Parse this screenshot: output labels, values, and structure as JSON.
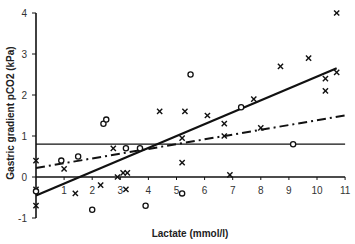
{
  "chart_data": {
    "type": "scatter",
    "title": "",
    "xlabel": "Lactate (mmol/l)",
    "ylabel": "Gastric gradient pCO2 (kPa)",
    "xlim": [
      0,
      11
    ],
    "ylim": [
      -1,
      4
    ],
    "x_ticks": [
      "1",
      "2",
      "3",
      "4",
      "5",
      "6",
      "7",
      "8",
      "9",
      "10",
      "11"
    ],
    "y_ticks": [
      "-1",
      "0",
      "1",
      "2",
      "3",
      "4"
    ],
    "grid": false,
    "legend": null,
    "series": [
      {
        "name": "crosses",
        "marker": "x",
        "points": [
          [
            0,
            0.4
          ],
          [
            0,
            -0.3
          ],
          [
            0,
            -0.7
          ],
          [
            1.0,
            0.2
          ],
          [
            1.4,
            -0.4
          ],
          [
            2.3,
            -0.2
          ],
          [
            2.75,
            0.7
          ],
          [
            2.9,
            0.0
          ],
          [
            3.1,
            0.1
          ],
          [
            3.25,
            0.1
          ],
          [
            3.2,
            -0.3
          ],
          [
            4.4,
            1.6
          ],
          [
            5.3,
            1.6
          ],
          [
            5.2,
            0.95
          ],
          [
            5.2,
            0.35
          ],
          [
            6.1,
            1.5
          ],
          [
            6.7,
            1.3
          ],
          [
            6.7,
            1.0
          ],
          [
            6.9,
            0.05
          ],
          [
            7.75,
            1.9
          ],
          [
            8.0,
            1.2
          ],
          [
            8.7,
            2.7
          ],
          [
            9.7,
            2.9
          ],
          [
            10.3,
            2.4
          ],
          [
            10.3,
            2.1
          ],
          [
            10.7,
            2.55
          ],
          [
            10.7,
            4.0
          ]
        ]
      },
      {
        "name": "circles",
        "marker": "o",
        "points": [
          [
            0,
            -0.35
          ],
          [
            0.9,
            0.4
          ],
          [
            1.5,
            0.5
          ],
          [
            2.0,
            -0.8
          ],
          [
            2.4,
            1.3
          ],
          [
            2.5,
            1.4
          ],
          [
            3.2,
            0.7
          ],
          [
            3.7,
            0.7
          ],
          [
            3.9,
            -0.7
          ],
          [
            5.2,
            -0.4
          ],
          [
            5.5,
            2.5
          ],
          [
            7.3,
            1.7
          ],
          [
            9.15,
            0.8
          ]
        ]
      }
    ],
    "lines": [
      {
        "name": "regression-solid",
        "style": "solid",
        "from": [
          0,
          -0.45
        ],
        "to": [
          10.7,
          2.65
        ]
      },
      {
        "name": "regression-dashdot",
        "style": "dash-dot",
        "from": [
          0,
          0.22
        ],
        "to": [
          11,
          1.5
        ]
      },
      {
        "name": "reference-horizontal",
        "style": "solid-thin",
        "from": [
          0,
          0.8
        ],
        "to": [
          11,
          0.8
        ]
      }
    ]
  }
}
